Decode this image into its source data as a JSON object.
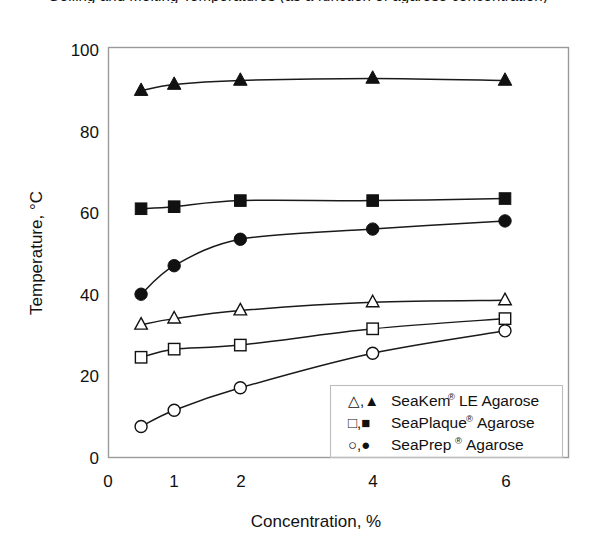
{
  "figure": {
    "title_clipped": "Gelling and Melting Temperatures (as a function of agarose concentration)",
    "background": "#ffffff",
    "ink_color": "#111111",
    "frame_color": "#9a9a9a"
  },
  "chart_data": {
    "type": "line",
    "title": "",
    "xlabel": "Concentration, %",
    "ylabel": "Temperature, °C",
    "x": [
      0.5,
      1,
      2,
      4,
      6
    ],
    "xlim": [
      0,
      6
    ],
    "ylim": [
      0,
      100
    ],
    "xticks": [
      0,
      1,
      2,
      4,
      6
    ],
    "xtick_labels": [
      "0",
      "1",
      "2",
      "4",
      "6"
    ],
    "yticks": [
      0,
      20,
      40,
      60,
      80,
      100
    ],
    "ytick_labels": [
      "0",
      "20",
      "40",
      "60",
      "80",
      "100"
    ],
    "grid": false,
    "legend_position": "lower right",
    "series": [
      {
        "name": "SeaKem LE Agarose melting",
        "marker": "filled-triangle",
        "values": [
          90,
          91.5,
          92.5,
          93,
          92.5
        ]
      },
      {
        "name": "SeaPlaque Agarose melting",
        "marker": "filled-square",
        "values": [
          61,
          61.5,
          63,
          63,
          63.5
        ]
      },
      {
        "name": "SeaPrep Agarose melting",
        "marker": "filled-circle",
        "values": [
          40,
          47,
          53.5,
          56,
          58
        ]
      },
      {
        "name": "SeaKem LE Agarose gelling",
        "marker": "open-triangle",
        "values": [
          32.5,
          34,
          36,
          38,
          38.5
        ]
      },
      {
        "name": "SeaPlaque Agarose gelling",
        "marker": "open-square",
        "values": [
          24.5,
          26.5,
          27.5,
          31.5,
          34
        ]
      },
      {
        "name": "SeaPrep Agarose gelling",
        "marker": "open-circle",
        "values": [
          7.5,
          11.5,
          17,
          25.5,
          31
        ]
      }
    ],
    "legend": [
      {
        "symbols": "△,▲",
        "name": "SeaKem",
        "mark": "®",
        "suffix": " LE Agarose"
      },
      {
        "symbols": "□,■",
        "name": "SeaPlaque",
        "mark": "®",
        "suffix": " Agarose"
      },
      {
        "symbols": "○,●",
        "name": "SeaPrep",
        "mark": "®",
        "suffix": " Agarose"
      }
    ]
  }
}
